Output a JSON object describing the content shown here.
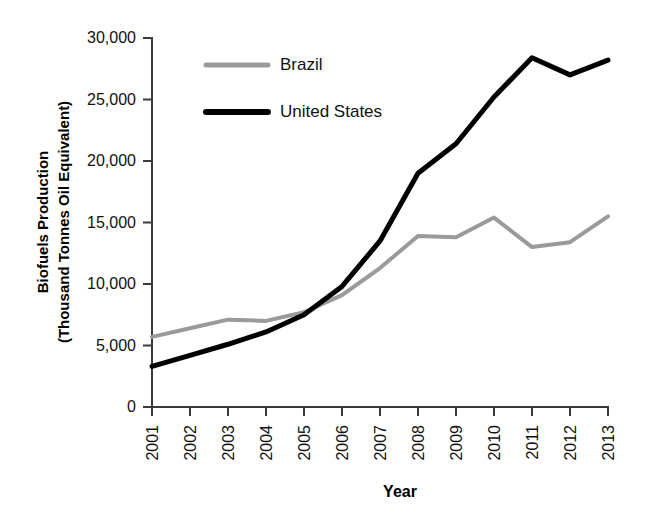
{
  "chart_data": {
    "type": "line",
    "title": "",
    "xlabel": "Year",
    "ylabel": "Biofuels Production (Thousand Tonnes Oil Equivalent)",
    "ylabel_line1": "Biofuels Production",
    "ylabel_line2": "(Thousand Tonnes Oil Equivalent)",
    "categories": [
      "2001",
      "2002",
      "2003",
      "2004",
      "2005",
      "2006",
      "2007",
      "2008",
      "2009",
      "2010",
      "2011",
      "2012",
      "2013"
    ],
    "x": [
      2001,
      2002,
      2003,
      2004,
      2005,
      2006,
      2007,
      2008,
      2009,
      2010,
      2011,
      2012,
      2013
    ],
    "series": [
      {
        "name": "Brazil",
        "color": "#9a9a9a",
        "width": 4,
        "values": [
          5700,
          6400,
          7100,
          7000,
          7700,
          9100,
          11300,
          13900,
          13800,
          15400,
          13000,
          13400,
          15500
        ]
      },
      {
        "name": "United States",
        "color": "#000000",
        "width": 5,
        "values": [
          3300,
          4200,
          5100,
          6100,
          7500,
          9800,
          13500,
          19000,
          21400,
          25200,
          28400,
          27000,
          28200
        ]
      }
    ],
    "ylim": [
      0,
      30000
    ],
    "yticks": [
      0,
      5000,
      10000,
      15000,
      20000,
      25000,
      30000
    ],
    "ytick_labels": [
      "0",
      "5,000",
      "10,000",
      "15,000",
      "20,000",
      "25,000",
      "30,000"
    ],
    "xlim": [
      2001,
      2013
    ],
    "grid": false,
    "legend_position": "top-center",
    "legend": [
      {
        "label": "Brazil",
        "color": "#9a9a9a"
      },
      {
        "label": "United States",
        "color": "#000000"
      }
    ]
  },
  "legend": {
    "brazil_label": "Brazil",
    "united_states_label": "United States"
  },
  "axes": {
    "x_title": "Year",
    "y_title_line1": "Biofuels Production",
    "y_title_line2": "(Thousand Tonnes Oil Equivalent)"
  }
}
